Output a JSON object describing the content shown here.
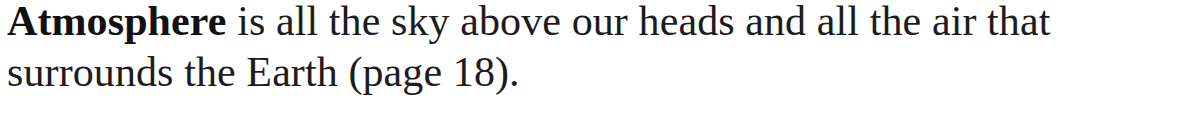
{
  "glossary_entry": {
    "term": "Atmosphere",
    "definition_line1": " is all the sky above our heads and all the air that",
    "definition_line2": "surrounds the Earth (page 18).",
    "full_text": "Atmosphere is all the sky above our heads and all the air that surrounds the Earth (page 18).",
    "page_reference": "18"
  },
  "colors": {
    "text": "#1c1c1c",
    "background": "#ffffff"
  }
}
